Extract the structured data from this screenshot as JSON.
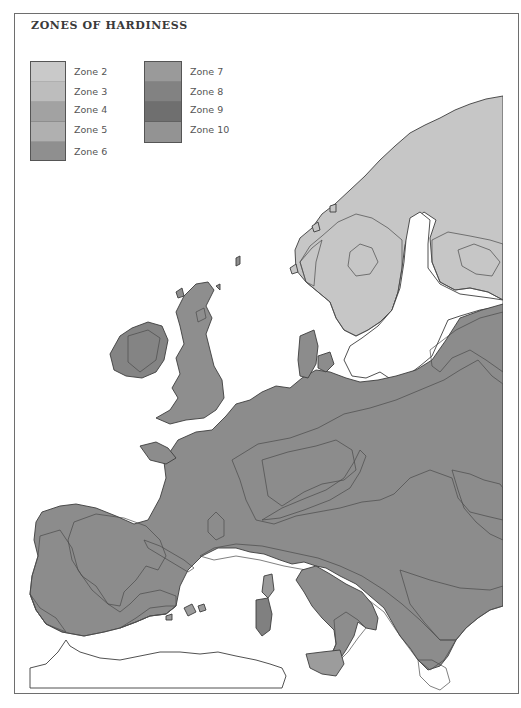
{
  "map": {
    "title": "ZONES OF HARDINESS",
    "region": "Europe",
    "legend": {
      "column_1": [
        {
          "label": "Zone 2",
          "color": "#c9c9c9"
        },
        {
          "label": "Zone 3",
          "color": "#bdbdbd"
        },
        {
          "label": "Zone 4",
          "color": "#a2a2a2"
        },
        {
          "label": "Zone 5",
          "color": "#b0b0b0"
        },
        {
          "label": "Zone 6",
          "color": "#8f8f8f"
        }
      ],
      "column_2": [
        {
          "label": "Zone 7",
          "color": "#9a9a9a"
        },
        {
          "label": "Zone 8",
          "color": "#828282"
        },
        {
          "label": "Zone 9",
          "color": "#6f6f6f"
        },
        {
          "label": "Zone 10",
          "color": "#939393"
        }
      ]
    },
    "colors": {
      "frame": "#6e6e6e",
      "coastline": "#3d3d3d",
      "sea": "#ffffff"
    }
  }
}
